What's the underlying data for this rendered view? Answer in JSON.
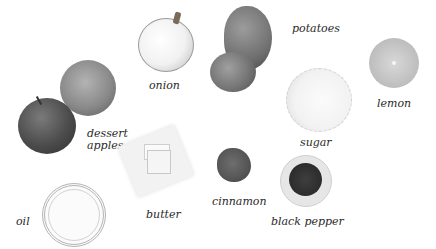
{
  "ingredients": [
    {
      "id": "onion",
      "label": "onion"
    },
    {
      "id": "potatoes",
      "label": "potatoes"
    },
    {
      "id": "lemon",
      "label": "lemon"
    },
    {
      "id": "dessert_apples",
      "label_line1": "dessert",
      "label_line2": "apples"
    },
    {
      "id": "sugar",
      "label": "sugar"
    },
    {
      "id": "butter",
      "label": "butter"
    },
    {
      "id": "cinnamon",
      "label": "cinnamon"
    },
    {
      "id": "black_pepper",
      "label": "black pepper"
    },
    {
      "id": "oil",
      "label": "oil"
    }
  ],
  "labels": {
    "onion": "onion",
    "potatoes": "potatoes",
    "lemon": "lemon",
    "dessert": "dessert",
    "apples": "apples",
    "sugar": "sugar",
    "butter": "butter",
    "cinnamon": "cinnamon",
    "black_pepper": "black pepper",
    "oil": "oil"
  }
}
